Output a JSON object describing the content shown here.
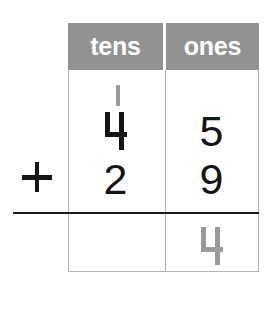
{
  "worksheet": {
    "type": "vertical-addition-place-value",
    "operator": "+",
    "columns": [
      {
        "id": "tens",
        "header": "tens"
      },
      {
        "id": "ones",
        "header": "ones"
      }
    ],
    "carry": {
      "column": "tens",
      "value": "1",
      "style": "tally-stroke",
      "color": "#9a9a9a"
    },
    "addend_1": {
      "tens": "4",
      "ones": "5"
    },
    "addend_2": {
      "tens": "2",
      "ones": "9"
    },
    "sum": {
      "tens": "",
      "ones": "4"
    },
    "colors": {
      "header_background": "#929292",
      "header_text": "#ffffff",
      "grid_line": "#b0b0b0",
      "digit": "#151515",
      "answer_digit": "#9a9a9a",
      "sum_rule": "#1a1a1a",
      "page_background": "#ffffff"
    }
  }
}
